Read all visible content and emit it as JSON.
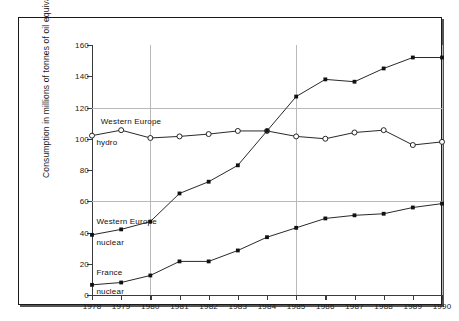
{
  "chart_data": {
    "type": "line",
    "title": "",
    "xlabel": "",
    "ylabel": "Consumption in millions of tonnes of oil equivalent",
    "x": [
      1978,
      1979,
      1980,
      1981,
      1982,
      1983,
      1984,
      1985,
      1986,
      1987,
      1988,
      1989,
      1990
    ],
    "xticklabels": [
      "1978",
      "1979",
      "1980",
      "1981",
      "1982",
      "1983",
      "1984",
      "1985",
      "1986",
      "1987",
      "1988",
      "1989",
      "1990"
    ],
    "yticklabels": [
      "0",
      "20",
      "40",
      "60",
      "80",
      "100",
      "120",
      "140",
      "160"
    ],
    "yticks": [
      0,
      20,
      40,
      60,
      80,
      100,
      120,
      140,
      160
    ],
    "ylim": [
      0,
      160
    ],
    "xlim": [
      1978,
      1990
    ],
    "grid": "horizontal gridlines at 60 and 120; vertical gridlines at 1980, 1985, 1990",
    "legend": "inline annotations next to each curve",
    "series": [
      {
        "name": "Western Europe hydro",
        "marker": "open-circle",
        "color": "#111111",
        "values": [
          102,
          105.5,
          100.5,
          101.5,
          103,
          105,
          105,
          101.5,
          100,
          104,
          105.5,
          96,
          98
        ]
      },
      {
        "name": "Western Europe nuclear",
        "marker": "filled-square",
        "color": "#111111",
        "values": [
          38.5,
          42,
          47,
          65,
          72.5,
          83,
          105,
          127,
          138,
          136.5,
          145,
          152,
          152
        ]
      },
      {
        "name": "France nuclear",
        "marker": "filled-square",
        "color": "#111111",
        "values": [
          6.5,
          8,
          12.5,
          21.5,
          21.5,
          28.5,
          37,
          43,
          49,
          51,
          52,
          56,
          58.5
        ]
      }
    ],
    "annotations": [
      {
        "id": "ann-we-hydro-line1",
        "text": "Western Europe",
        "x": 1978.3,
        "y": 111
      },
      {
        "id": "ann-we-hydro-line2",
        "text": "hydro",
        "x": 1978.15,
        "y": 97
      },
      {
        "id": "ann-we-nuclear-line1",
        "text": "Western Europe",
        "x": 1978.15,
        "y": 47
      },
      {
        "id": "ann-we-nuclear-line2",
        "text": "nuclear",
        "x": 1978.15,
        "y": 33
      },
      {
        "id": "ann-fr-nuclear-line1",
        "text": "France",
        "x": 1978.15,
        "y": 14
      },
      {
        "id": "ann-fr-nuclear-line2",
        "text": "nuclear",
        "x": 1978.15,
        "y": 2
      }
    ]
  },
  "colors": {
    "ink": "#111111",
    "axis": "#3a3a3a",
    "grid": "#b9b9b9",
    "frame": "#1a1a1a",
    "background": "#ffffff"
  }
}
